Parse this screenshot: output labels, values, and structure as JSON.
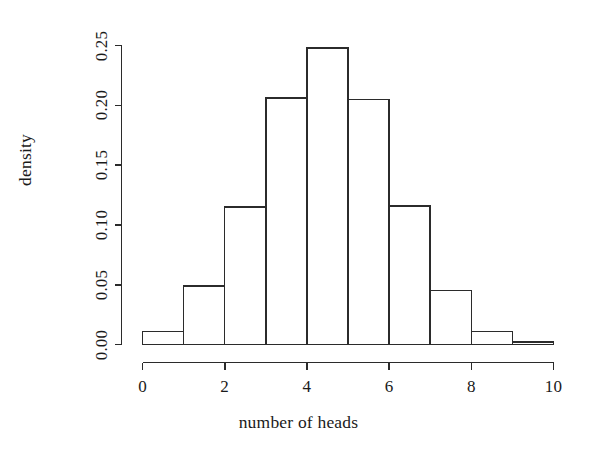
{
  "chart_data": {
    "type": "bar",
    "title": "",
    "subtitle": "",
    "xlabel": "number of heads",
    "ylabel": "density",
    "xlim": [
      0,
      10
    ],
    "ylim": [
      0.0,
      0.25
    ],
    "grid": false,
    "legend": null,
    "bin_width": 1,
    "bin_edges": [
      0,
      1,
      2,
      3,
      4,
      5,
      6,
      7,
      8,
      9,
      10
    ],
    "categories": [
      "0-1",
      "1-2",
      "2-3",
      "3-4",
      "4-5",
      "5-6",
      "6-7",
      "7-8",
      "8-9",
      "9-10"
    ],
    "values": [
      0.011,
      0.049,
      0.115,
      0.206,
      0.248,
      0.205,
      0.116,
      0.045,
      0.011,
      0.002
    ],
    "xticks": [
      0,
      2,
      4,
      6,
      8,
      10
    ],
    "xtick_labels": [
      "0",
      "2",
      "4",
      "6",
      "8",
      "10"
    ],
    "yticks": [
      0.0,
      0.05,
      0.1,
      0.15,
      0.2,
      0.25
    ],
    "ytick_labels": [
      "0.00",
      "0.05",
      "0.10",
      "0.15",
      "0.20",
      "0.25"
    ],
    "bar_fill": "#ffffff",
    "bar_stroke": "#2b2b2b",
    "axis_color": "#2b2b2b",
    "background": "#ffffff"
  },
  "axes": {
    "x_title": "number of heads",
    "y_title": "density"
  },
  "ticks": {
    "y": [
      {
        "label": "0.00",
        "value": 0.0
      },
      {
        "label": "0.05",
        "value": 0.05
      },
      {
        "label": "0.10",
        "value": 0.1
      },
      {
        "label": "0.15",
        "value": 0.15
      },
      {
        "label": "0.20",
        "value": 0.2
      },
      {
        "label": "0.25",
        "value": 0.25
      }
    ],
    "x": [
      {
        "label": "0",
        "value": 0
      },
      {
        "label": "2",
        "value": 2
      },
      {
        "label": "4",
        "value": 4
      },
      {
        "label": "6",
        "value": 6
      },
      {
        "label": "8",
        "value": 8
      },
      {
        "label": "10",
        "value": 10
      }
    ]
  }
}
